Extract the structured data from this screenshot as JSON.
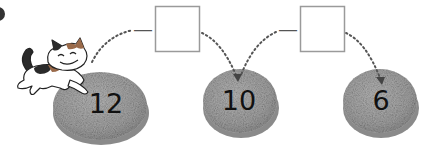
{
  "problem": {
    "marker": "bullet",
    "description": "Cat jumps from stone to stone, subtracting each step"
  },
  "stones": [
    {
      "id": "stone-1",
      "value": "12",
      "cx": 100,
      "cy": 108,
      "rx": 48,
      "ry": 36
    },
    {
      "id": "stone-2",
      "value": "10",
      "cx": 240,
      "cy": 103,
      "rx": 38,
      "ry": 34
    },
    {
      "id": "stone-3",
      "value": "6",
      "cx": 380,
      "cy": 103,
      "rx": 38,
      "ry": 34
    }
  ],
  "operations": [
    {
      "operator": "—",
      "answer": "",
      "box": {
        "x": 155,
        "y": 6,
        "w": 45,
        "h": 46
      }
    },
    {
      "operator": "—",
      "answer": "",
      "box": {
        "x": 299,
        "y": 6,
        "w": 45,
        "h": 46
      }
    }
  ],
  "character": {
    "name": "cat",
    "colors": [
      "#222222",
      "#9a6a4a",
      "#ffffff"
    ]
  },
  "colors": {
    "stone_fill": "#a9a9a9",
    "stone_side": "#8e8e8e",
    "box_border": "#9a9a9a",
    "dots": "#555555"
  }
}
